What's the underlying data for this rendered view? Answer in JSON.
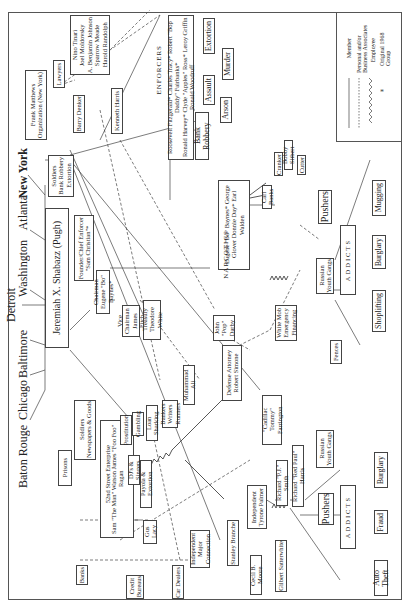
{
  "diagram": {
    "orientation": "rotated-90-ccw",
    "cities": [
      "Baton Rouge",
      "Chicago",
      "Baltimore",
      "Detroit",
      "Washington",
      "Atlanta",
      "New York"
    ],
    "leader": {
      "name": "Jeremiah X. Shabazz (Pugh)",
      "small_top": "Advisors",
      "small_bottom": "Advisors"
    },
    "prisons": "Prisons",
    "soldiers_news": "Soldiers\nNewspapers & Goods",
    "soldiers_bank": "Soldiers\nBank Robbery\nExtortion",
    "founder": "Founder/Chief Enforcer\n\"Sam Christian\"*",
    "chairman": "Chairman\nEugene \"Bo\" Baynes*",
    "vice_chairman": "Vice Chairman\nJames Fitch",
    "treasury": "Treasury\nTheodore White",
    "muhammad_ali": "Muhammad Ali",
    "defense_attorney": "Defense Attorney\nRobert Simone",
    "john_pop": "John\n\"Pop\"\nDarby",
    "cadillac": "\"Cadillac Tommy\"\nFarrington",
    "white_mob": "White Mob\nEmergency\nFinancing",
    "fences": "Fences",
    "frank_matthews": "Frank Matthews\nOrganization (New York)",
    "lawyers": "Lawyers",
    "barry_denker": "Barry Denker",
    "kenneth_harris": "Kenneth Harris",
    "lawyer_names": "Nino Tinari\nJoel Moldovsky\nA. Benjamin Johnson\nSparrow Meade\nHarold Randolph",
    "enforcers": {
      "title": "ENFORCERS",
      "members": "Roosevelt Fitzgerald*  Charles Tracy*  Robert \"Bop Daddy\" Fairbanks*\nRonald Harvey*  Clyde \"Apples\" Ross*  Leroy Griffin  Ronald Woodruff"
    },
    "enforcer_crimes": [
      "Bank Robbery",
      "Arson",
      "Assault",
      "Murder",
      "Extortion"
    ],
    "narcotics": {
      "title": "NARCOTICS",
      "members": "Eugene \"Bo\" Baynes*   George Glover   Donnie Day*   Earl Walden"
    },
    "carl_banks": "Carl Banks",
    "carl_associates": [
      "Cranker",
      "Bobby Sitbert",
      "Cutter"
    ],
    "pushers_top": "Pushers",
    "russian_top": "Russian\nYouth Gangs",
    "addicts_top": "ADDICTS",
    "addict_crimes_top": [
      "Shoplifting",
      "Burglary",
      "Mugging"
    ],
    "street_enterprise": {
      "title": "52nd Street Enterprise",
      "members": "Sam \"The Man\" Watson   James \"Foo Foo\" Ragan"
    },
    "prostitution": "Prostitution",
    "gambling": "Gambling",
    "loan_sharking": "Loan Sharking",
    "loan_sharks": "Bankers\nWriters\nRunners",
    "djs": "DJ's & Singers",
    "payola": "Payola & Extortion",
    "gus_lacy": "Gus Lacy",
    "independent_major": "Independent\nMajor Connection",
    "banks": "Banks",
    "credit_bureaus": "Credit\nBureaus",
    "car_dealers": "Car Dealers",
    "stanley_branche": "Stanley Branche",
    "cecil_moore": "Cecil B. Moore",
    "gilbert": "Gilbert Satterwhite",
    "independent_tyrone": "Independent\nTyrone Palmer",
    "richard_smith": "Richard \"P.J.\" Smith",
    "richard_harris": "Richard \"Red Paul\" Harris",
    "pushers_bottom": "Pushers",
    "russian_bottom": "Russian\nYouth Gangs",
    "addicts_bottom": "ADDICTS",
    "addict_crimes_bottom": [
      "Auto Theft",
      "Fraud",
      "Burglary"
    ]
  },
  "legend": {
    "items": [
      {
        "style": "solid",
        "label": "Member"
      },
      {
        "style": "dotted",
        "label": "Personal and/or Business Associates"
      },
      {
        "style": "zigzag",
        "label": "Employee"
      },
      {
        "style": "asterisk",
        "label": "Original 1968 Group"
      }
    ]
  }
}
